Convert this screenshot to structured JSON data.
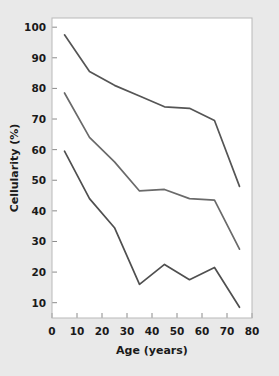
{
  "chart_data": {
    "type": "line",
    "title": "",
    "xlabel": "Age (years)",
    "ylabel": "Cellularity (%)",
    "xlim": [
      0,
      80
    ],
    "ylim": [
      5,
      103
    ],
    "xticks": [
      0,
      10,
      20,
      30,
      40,
      50,
      60,
      70,
      80
    ],
    "xtick_labels": [
      "0",
      "10",
      "20",
      "30",
      "40",
      "50",
      "60",
      "70",
      "80"
    ],
    "yticks": [
      10,
      20,
      30,
      40,
      50,
      60,
      70,
      80,
      90,
      100
    ],
    "ytick_labels": [
      "10",
      "20",
      "30",
      "40",
      "50",
      "60",
      "70",
      "80",
      "90",
      "100"
    ],
    "grid": false,
    "legend": "none",
    "x": [
      5,
      15,
      25,
      35,
      45,
      55,
      65,
      75
    ],
    "series": [
      {
        "name": "upper-percentile",
        "color": "#555555",
        "values": [
          97.5,
          85.5,
          81.0,
          77.5,
          74.0,
          73.5,
          69.5,
          48.0
        ]
      },
      {
        "name": "median",
        "color": "#6a6a6a",
        "values": [
          78.5,
          64.0,
          56.0,
          46.5,
          47.0,
          44.0,
          43.5,
          27.5
        ]
      },
      {
        "name": "lower-percentile",
        "color": "#4f4f4f",
        "values": [
          59.5,
          44.0,
          34.5,
          16.0,
          22.5,
          17.5,
          21.5,
          8.5
        ]
      }
    ]
  },
  "colors": {
    "background": "#e9e9e9",
    "plot_area": "#ffffff",
    "frame": "#b9b9b9",
    "tick": "#8a8a8a",
    "text": "#1a1a1a"
  }
}
